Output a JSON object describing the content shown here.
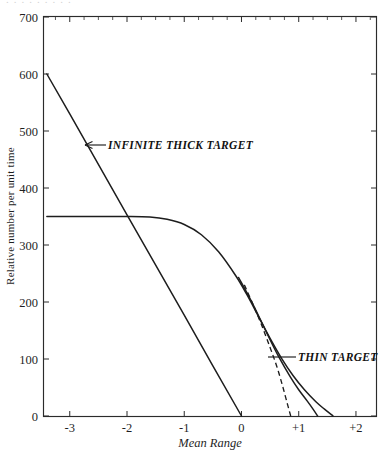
{
  "figure": {
    "scan_artifact_text": "........."
  },
  "chart_data": {
    "type": "line",
    "title": "",
    "xlabel": "Mean Range",
    "ylabel": "Relative number per unit time",
    "xlim": [
      -3.45,
      2.35
    ],
    "ylim": [
      0,
      700
    ],
    "grid": false,
    "legend_position": "inline-annotations",
    "x_ticks": [
      {
        "value": -3,
        "label": "-3"
      },
      {
        "value": -2,
        "label": "-2"
      },
      {
        "value": -1,
        "label": "-1"
      },
      {
        "value": 0,
        "label": "0"
      },
      {
        "value": 1,
        "label": "+1"
      },
      {
        "value": 2,
        "label": "+2"
      }
    ],
    "x_minor_tick_step": 0.25,
    "y_ticks": [
      {
        "value": 0,
        "label": "0"
      },
      {
        "value": 100,
        "label": "100"
      },
      {
        "value": 200,
        "label": "200"
      },
      {
        "value": 300,
        "label": "300"
      },
      {
        "value": 400,
        "label": "400"
      },
      {
        "value": 500,
        "label": "500"
      },
      {
        "value": 600,
        "label": "600"
      },
      {
        "value": 700,
        "label": "700"
      }
    ],
    "series": [
      {
        "name": "Infinite Thick Target",
        "style": "solid-straight",
        "annotation": "INFINITE THICK TARGET",
        "points": [
          {
            "x": -3.4,
            "y": 600
          },
          {
            "x": -3.0,
            "y": 530
          },
          {
            "x": -2.0,
            "y": 353
          },
          {
            "x": -1.0,
            "y": 177
          },
          {
            "x": -0.5,
            "y": 88
          },
          {
            "x": 0.0,
            "y": 0
          }
        ]
      },
      {
        "name": "Thin Target",
        "style": "solid-sigmoid",
        "annotation": "THIN TARGET",
        "points": [
          {
            "x": -3.4,
            "y": 350
          },
          {
            "x": -3.0,
            "y": 350
          },
          {
            "x": -2.5,
            "y": 350
          },
          {
            "x": -2.0,
            "y": 350
          },
          {
            "x": -1.6,
            "y": 349
          },
          {
            "x": -1.3,
            "y": 345
          },
          {
            "x": -1.0,
            "y": 336
          },
          {
            "x": -0.7,
            "y": 318
          },
          {
            "x": -0.4,
            "y": 288
          },
          {
            "x": -0.1,
            "y": 246
          },
          {
            "x": 0.1,
            "y": 212
          },
          {
            "x": 0.3,
            "y": 174
          },
          {
            "x": 0.5,
            "y": 136
          },
          {
            "x": 0.7,
            "y": 101
          },
          {
            "x": 0.9,
            "y": 71
          },
          {
            "x": 1.1,
            "y": 46
          },
          {
            "x": 1.3,
            "y": 25
          },
          {
            "x": 1.45,
            "y": 12
          },
          {
            "x": 1.6,
            "y": 0
          }
        ]
      },
      {
        "name": "Thin Target dashed branch",
        "style": "dashed",
        "annotation": "",
        "points": [
          {
            "x": 0.05,
            "y": 230
          },
          {
            "x": 0.2,
            "y": 196
          },
          {
            "x": 0.35,
            "y": 160
          },
          {
            "x": 0.5,
            "y": 120
          },
          {
            "x": 0.62,
            "y": 86
          },
          {
            "x": 0.72,
            "y": 52
          },
          {
            "x": 0.8,
            "y": 22
          },
          {
            "x": 0.86,
            "y": 0
          }
        ]
      },
      {
        "name": "Thin Target secondary solid",
        "style": "solid",
        "annotation": "",
        "points": [
          {
            "x": -0.05,
            "y": 243
          },
          {
            "x": 0.2,
            "y": 196
          },
          {
            "x": 0.45,
            "y": 144
          },
          {
            "x": 0.65,
            "y": 104
          },
          {
            "x": 0.85,
            "y": 69
          },
          {
            "x": 1.0,
            "y": 46
          },
          {
            "x": 1.15,
            "y": 26
          },
          {
            "x": 1.25,
            "y": 12
          },
          {
            "x": 1.33,
            "y": 0
          }
        ]
      }
    ],
    "annotations": [
      {
        "id": "infinite-thick-target",
        "text": "INFINITE THICK TARGET",
        "arrow": "left",
        "x": -2.25,
        "y": 468
      },
      {
        "id": "thin-target",
        "text": "THIN TARGET",
        "arrow": "leader-left",
        "x": 0.95,
        "y": 118
      }
    ]
  }
}
